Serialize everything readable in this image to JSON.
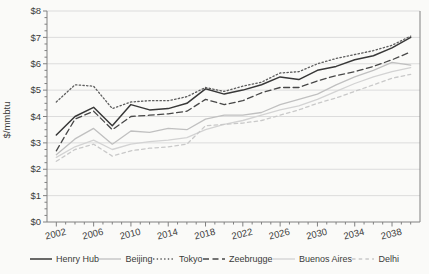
{
  "chart_data": {
    "type": "line",
    "title": "",
    "xlabel": "",
    "ylabel": "$/mmbtu",
    "ylim": [
      0,
      8
    ],
    "xlim": [
      2001,
      2041
    ],
    "grid": "horizontal-gridlines",
    "legend_position": "bottom",
    "y_tick_prefix": "$",
    "y_ticks": [
      0,
      1,
      2,
      3,
      4,
      5,
      6,
      7,
      8
    ],
    "x_tick_labels": [
      2002,
      2006,
      2010,
      2014,
      2018,
      2022,
      2026,
      2030,
      2034,
      2038
    ],
    "x": [
      2002,
      2004,
      2006,
      2008,
      2010,
      2012,
      2014,
      2016,
      2018,
      2020,
      2022,
      2024,
      2026,
      2028,
      2030,
      2032,
      2034,
      2036,
      2038,
      2040
    ],
    "series": [
      {
        "name": "Henry Hub",
        "color": "#383838",
        "style": "solid",
        "values": [
          3.3,
          4.0,
          4.35,
          3.65,
          4.45,
          4.25,
          4.3,
          4.5,
          5.05,
          4.85,
          5.0,
          5.2,
          5.5,
          5.4,
          5.75,
          5.9,
          6.15,
          6.3,
          6.6,
          7.0
        ]
      },
      {
        "name": "Beijing",
        "color": "#c0c0c0",
        "style": "solid",
        "values": [
          2.55,
          3.15,
          3.55,
          2.95,
          3.45,
          3.4,
          3.55,
          3.5,
          3.9,
          4.05,
          4.05,
          4.15,
          4.45,
          4.65,
          4.85,
          5.2,
          5.5,
          5.75,
          6.05,
          5.95
        ]
      },
      {
        "name": "Tokyo",
        "color": "#5e5e5e",
        "style": "dotted",
        "values": [
          4.55,
          5.2,
          5.15,
          4.3,
          4.55,
          4.6,
          4.6,
          4.75,
          5.1,
          4.95,
          5.15,
          5.3,
          5.65,
          5.7,
          6.0,
          6.2,
          6.35,
          6.5,
          6.7,
          7.05
        ]
      },
      {
        "name": "Zeebrugge",
        "color": "#474747",
        "style": "dashed",
        "values": [
          2.7,
          3.9,
          4.2,
          3.5,
          4.0,
          4.05,
          4.1,
          4.2,
          4.65,
          4.45,
          4.6,
          4.9,
          5.1,
          5.1,
          5.35,
          5.55,
          5.7,
          5.9,
          6.15,
          6.45
        ]
      },
      {
        "name": "Buenos Aires",
        "color": "#d3d3d3",
        "style": "solid",
        "values": [
          2.45,
          2.85,
          3.1,
          2.75,
          2.95,
          3.05,
          3.1,
          3.2,
          3.5,
          3.7,
          3.85,
          4.05,
          4.25,
          4.4,
          4.65,
          4.95,
          5.25,
          5.5,
          5.7,
          5.85
        ]
      },
      {
        "name": "Delhi",
        "color": "#c9c9c9",
        "style": "shortdash",
        "values": [
          2.3,
          2.75,
          2.95,
          2.5,
          2.7,
          2.8,
          2.85,
          2.95,
          3.65,
          3.7,
          3.75,
          3.85,
          4.05,
          4.25,
          4.5,
          4.7,
          4.95,
          5.2,
          5.45,
          5.6
        ]
      }
    ]
  }
}
